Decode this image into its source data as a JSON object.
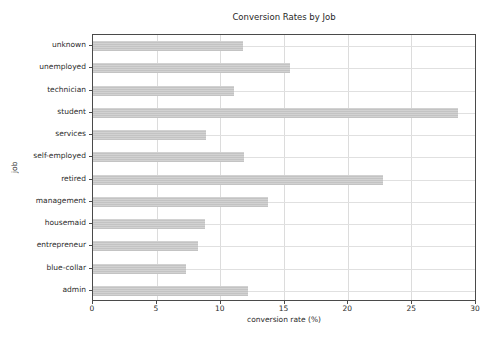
{
  "chart_data": {
    "type": "bar",
    "orientation": "horizontal",
    "title": "Conversion Rates by Job",
    "xlabel": "conversion rate (%)",
    "ylabel": "job",
    "categories_top_to_bottom": [
      "unknown",
      "unemployed",
      "technician",
      "student",
      "services",
      "self-employed",
      "retired",
      "management",
      "housemaid",
      "entrepreneur",
      "blue-collar",
      "admin"
    ],
    "values": [
      11.8,
      15.5,
      11.06,
      28.68,
      8.88,
      11.84,
      22.79,
      13.76,
      8.79,
      8.27,
      7.27,
      12.2
    ],
    "xlim": [
      0,
      30
    ],
    "xticks": [
      0,
      5,
      10,
      15,
      20,
      25,
      30
    ],
    "grid": true,
    "legend": "none",
    "bar_color": "#c9c9c9",
    "grid_color": "#dedede",
    "spine_color": "#4a4a4a",
    "background_color": "#ffffff"
  }
}
